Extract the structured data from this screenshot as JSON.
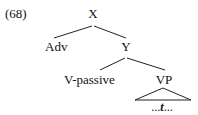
{
  "example_number": "(68)",
  "tree": {
    "root": {
      "label": "X",
      "children": [
        {
          "label": "Adv"
        },
        {
          "label": "Y",
          "children": [
            {
              "label": "V-passive"
            },
            {
              "label": "VP",
              "triangle": true,
              "content": {
                "prefix": "...",
                "trace": "t",
                "suffix": "..."
              }
            }
          ]
        }
      ]
    }
  }
}
